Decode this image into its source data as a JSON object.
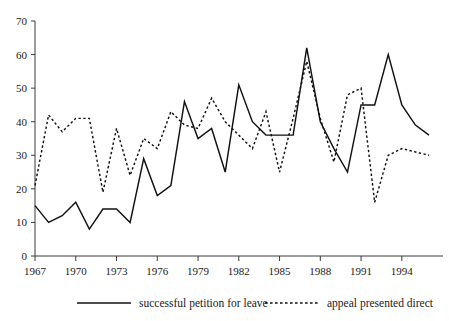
{
  "chart_data": {
    "type": "line",
    "title": "",
    "subtitle": "",
    "xlabel": "",
    "ylabel": "",
    "xlim": [
      1967,
      1996
    ],
    "ylim": [
      0,
      70
    ],
    "grid": false,
    "legend_position": "bottom",
    "x": [
      1967,
      1968,
      1969,
      1970,
      1971,
      1972,
      1973,
      1974,
      1975,
      1976,
      1977,
      1978,
      1979,
      1980,
      1981,
      1982,
      1983,
      1984,
      1985,
      1986,
      1987,
      1988,
      1989,
      1990,
      1991,
      1992,
      1993,
      1994,
      1995,
      1996
    ],
    "x_tick_labels": [
      "1967",
      "1970",
      "1973",
      "1976",
      "1979",
      "1982",
      "1985",
      "1988",
      "1991",
      "1994"
    ],
    "x_tick_values": [
      1967,
      1970,
      1973,
      1976,
      1979,
      1982,
      1985,
      1988,
      1991,
      1994
    ],
    "y_tick_labels": [
      "0",
      "10",
      "20",
      "30",
      "40",
      "50",
      "60",
      "70"
    ],
    "y_tick_values": [
      0,
      10,
      20,
      30,
      40,
      50,
      60,
      70
    ],
    "series": [
      {
        "name": "successful petition for leave",
        "style": "solid",
        "color": "#111111",
        "values": [
          15,
          10,
          12,
          16,
          8,
          14,
          14,
          10,
          29,
          18,
          21,
          46,
          35,
          38,
          25,
          51,
          40,
          36,
          36,
          36,
          62,
          40,
          32,
          25,
          45,
          45,
          60,
          45,
          39,
          36
        ]
      },
      {
        "name": "appeal presented direct",
        "style": "dotted",
        "color": "#111111",
        "values": [
          21,
          42,
          37,
          41,
          41,
          19,
          38,
          24,
          35,
          32,
          43,
          39,
          38,
          47,
          40,
          36,
          32,
          43,
          25,
          41,
          58,
          41,
          28,
          48,
          50,
          16,
          30,
          32,
          31,
          30
        ]
      }
    ]
  },
  "legend": {
    "entries": [
      {
        "label": "successful petition for leave",
        "style": "solid"
      },
      {
        "label": "appeal presented direct",
        "style": "dotted"
      }
    ]
  }
}
